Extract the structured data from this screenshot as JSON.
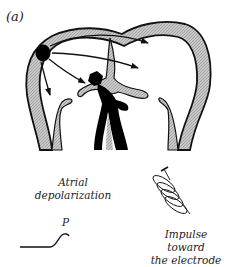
{
  "figure": {
    "panel_label": "(a)",
    "atrial_label_line1": "Atrial",
    "atrial_label_line2": "depolarization",
    "wave_label": "P",
    "impulse_label_line1": "Impulse toward",
    "impulse_label_line2": "the electrode"
  },
  "colors": {
    "outline": "#111111",
    "wall_fill": "#bdbdbd",
    "node_fill": "#000000",
    "text": "#222222",
    "background": "#ffffff"
  },
  "elements": {
    "sa_node": "sinoatrial-node",
    "arrows": [
      "to-left-atrium-upper",
      "to-left-atrium-mid",
      "to-av-node",
      "down-right-atrium"
    ],
    "av_node": "atrioventricular-node",
    "bundle": "bundle-of-his",
    "electrode": "electrode-coil",
    "waveform": "p-wave-trace"
  }
}
